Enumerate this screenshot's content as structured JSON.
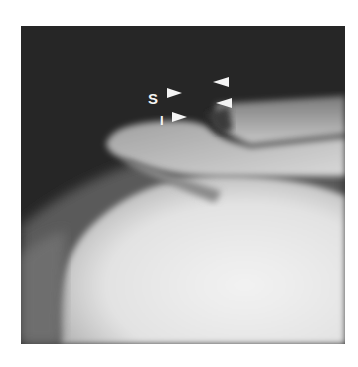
{
  "figure": {
    "type": "radiograph",
    "labels": [
      {
        "text": "S",
        "x": 148,
        "y": 91
      },
      {
        "text": "I",
        "x": 160,
        "y": 113
      }
    ],
    "arrowheads": [
      {
        "id": "s-arrow",
        "direction": "right",
        "x": 167,
        "y": 93
      },
      {
        "id": "i-arrow",
        "direction": "right",
        "x": 172,
        "y": 117
      },
      {
        "id": "upper-right-arrow",
        "direction": "left",
        "x": 213,
        "y": 82
      },
      {
        "id": "lower-right-arrow",
        "direction": "left",
        "x": 216,
        "y": 100
      }
    ],
    "colors": {
      "background": "#ffffff",
      "dark_field": "#2a2a2a",
      "bone": "#e8e8e8",
      "marker": "#f4f4f4"
    }
  }
}
